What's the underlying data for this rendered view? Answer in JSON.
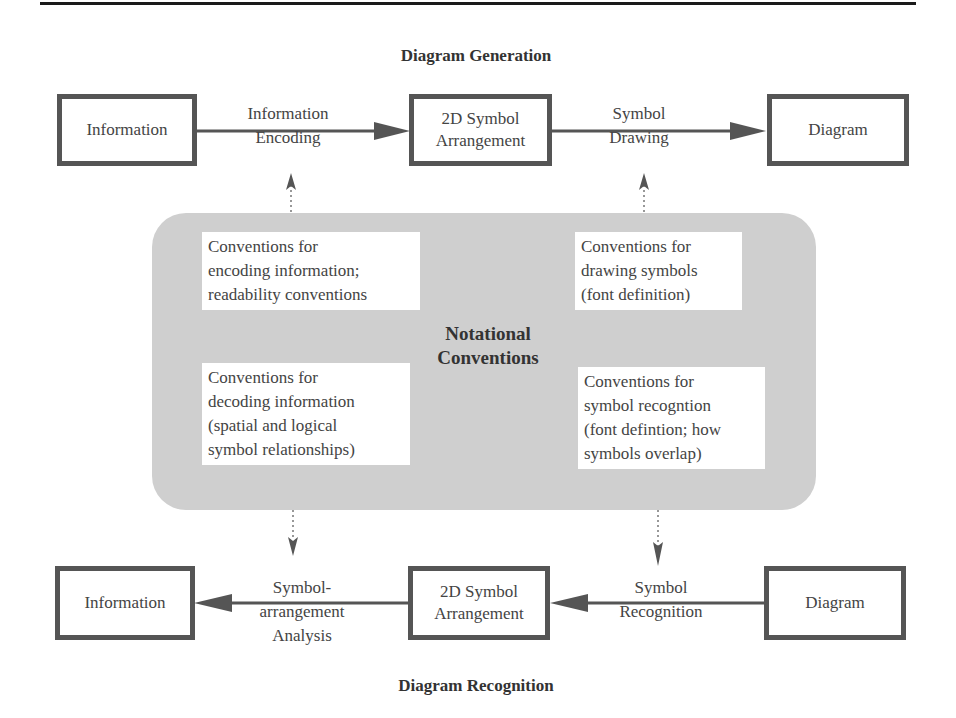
{
  "diagram": {
    "generation": {
      "title": "Diagram Generation",
      "nodes": [
        {
          "id": "gen-information",
          "label": "Information"
        },
        {
          "id": "gen-2d-symbol-arrangement",
          "label_line1": "2D Symbol",
          "label_line2": "Arrangement"
        },
        {
          "id": "gen-diagram",
          "label": "Diagram"
        }
      ],
      "edges": [
        {
          "from": "gen-information",
          "to": "gen-2d-symbol-arrangement",
          "label_line1": "Information",
          "label_line2": "Encoding"
        },
        {
          "from": "gen-2d-symbol-arrangement",
          "to": "gen-diagram",
          "label_line1": "Symbol",
          "label_line2": "Drawing"
        }
      ]
    },
    "conventions": {
      "title_line1": "Notational",
      "title_line2": "Conventions",
      "encoding": {
        "line1": "Conventions for",
        "line2": "encoding information;",
        "line3": "readability conventions"
      },
      "drawing": {
        "line1": "Conventions for",
        "line2": "drawing symbols",
        "line3": "(font definition)"
      },
      "decoding": {
        "line1": "Conventions for",
        "line2": "decoding information",
        "line3": "(spatial and logical",
        "line4": "symbol relationships)"
      },
      "recognition": {
        "line1": "Conventions for",
        "line2": "symbol recogntion",
        "line3": "(font defintion; how",
        "line4": "symbols overlap)"
      }
    },
    "recognition": {
      "title": "Diagram Recognition",
      "nodes": [
        {
          "id": "rec-information",
          "label": "Information"
        },
        {
          "id": "rec-2d-symbol-arrangement",
          "label_line1": "2D Symbol",
          "label_line2": "Arrangement"
        },
        {
          "id": "rec-diagram",
          "label": "Diagram"
        }
      ],
      "edges": [
        {
          "from": "rec-diagram",
          "to": "rec-2d-symbol-arrangement",
          "label_line1": "Symbol",
          "label_line2": "Recognition"
        },
        {
          "from": "rec-2d-symbol-arrangement",
          "to": "rec-information",
          "label_line1": "Symbol-",
          "label_line2": "arrangement",
          "label_line3": "Analysis"
        }
      ]
    },
    "colors": {
      "box_border": "#555555",
      "panel_fill": "#cfcfcf",
      "arrow": "#555555",
      "text": "#444444"
    }
  }
}
